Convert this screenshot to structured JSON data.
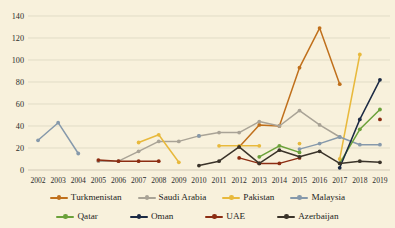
{
  "chart_data": {
    "type": "line",
    "title": "",
    "subtitle": "",
    "xlabel": "",
    "ylabel": "",
    "grid": true,
    "legend_position": "bottom",
    "ylim": [
      0,
      140
    ],
    "yticks": [
      0,
      20,
      40,
      60,
      80,
      100,
      120,
      140
    ],
    "categories": [
      "2002",
      "2003",
      "2004",
      "2005",
      "2006",
      "2007",
      "2008",
      "2009",
      "2010",
      "2011",
      "2012",
      "2013",
      "2014",
      "2015",
      "2016",
      "2017",
      "2018",
      "2019"
    ],
    "series": [
      {
        "name": "Turkmenistan",
        "color": "#c0701c",
        "values": [
          null,
          null,
          null,
          null,
          null,
          null,
          null,
          null,
          null,
          null,
          21,
          41,
          40,
          93,
          129,
          78,
          null,
          null
        ]
      },
      {
        "name": "Saudi Arabia",
        "color": "#a9a396",
        "values": [
          null,
          null,
          null,
          8,
          8,
          17,
          26,
          26,
          31,
          34,
          34,
          44,
          40,
          54,
          41,
          30,
          null,
          null
        ]
      },
      {
        "name": "Pakistan",
        "color": "#e8b93c",
        "values": [
          null,
          null,
          null,
          null,
          null,
          25,
          32,
          7,
          null,
          22,
          22,
          22,
          null,
          24,
          null,
          10,
          105,
          null
        ]
      },
      {
        "name": "Malaysia",
        "color": "#8699ab",
        "values": [
          27,
          43,
          15,
          null,
          null,
          null,
          null,
          null,
          31,
          null,
          null,
          null,
          null,
          19,
          24,
          30,
          23,
          23
        ]
      },
      {
        "name": "Qatar",
        "color": "#6ba13a",
        "values": [
          null,
          null,
          null,
          null,
          null,
          null,
          null,
          null,
          null,
          null,
          null,
          12,
          22,
          16,
          null,
          6,
          37,
          55
        ]
      },
      {
        "name": "Oman",
        "color": "#1b2a44",
        "values": [
          null,
          null,
          null,
          null,
          null,
          null,
          null,
          null,
          null,
          null,
          null,
          null,
          null,
          null,
          null,
          2,
          46,
          82
        ]
      },
      {
        "name": "UAE",
        "color": "#8c2d12",
        "values": [
          null,
          null,
          null,
          9,
          8,
          8,
          8,
          null,
          null,
          null,
          11,
          6,
          6,
          11,
          null,
          null,
          null,
          46
        ]
      },
      {
        "name": "Azerbaijan",
        "color": "#3a3329",
        "values": [
          null,
          null,
          null,
          null,
          null,
          null,
          null,
          null,
          4,
          8,
          21,
          6,
          18,
          12,
          17,
          6,
          8,
          7
        ]
      }
    ]
  },
  "legend": {
    "row1": [
      "Turkmenistan",
      "Saudi Arabia",
      "Pakistan",
      "Malaysia"
    ],
    "row2": [
      "Qatar",
      "Oman",
      "UAE",
      "Azerbaijan"
    ]
  },
  "colors": {
    "background": "#f8f1dc",
    "gridline": "#d8d2bd",
    "text": "#2b2b2b"
  }
}
